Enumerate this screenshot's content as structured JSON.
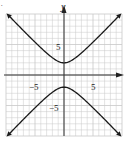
{
  "chart_data": {
    "type": "line",
    "title": "",
    "xlabel": "",
    "ylabel": "y",
    "xlim": [
      -10,
      10
    ],
    "ylim": [
      -10,
      10
    ],
    "grid": true,
    "grid_step": 1,
    "x_ticks_labeled": [
      {
        "value": -5,
        "label": "−5"
      },
      {
        "value": 5,
        "label": "5"
      }
    ],
    "y_ticks_labeled": [
      {
        "value": 5,
        "label": "5"
      },
      {
        "value": -5,
        "label": "−5"
      }
    ],
    "series": [
      {
        "name": "upper branch",
        "equation": "y^2/4 - x^2/4 = 1 (upper)",
        "vertex": [
          0,
          2
        ],
        "endpoints_arrows": [
          [
            -10,
            10.2
          ],
          [
            10,
            10.2
          ]
        ]
      },
      {
        "name": "lower branch",
        "equation": "y^2/4 - x^2/4 = 1 (lower)",
        "vertex": [
          0,
          -2
        ],
        "endpoints_arrows": [
          [
            -10,
            -10.2
          ],
          [
            10,
            -10.2
          ]
        ]
      }
    ],
    "curve": {
      "a": 2,
      "b": 2,
      "orientation": "vertical hyperbola"
    }
  },
  "labels": {
    "y_axis": "y",
    "x_tick_neg5": "−5",
    "x_tick_5": "5",
    "y_tick_5": "5",
    "y_tick_neg5": "−5"
  },
  "colors": {
    "grid": "#c8c8c8",
    "axis": "#333333",
    "curve": "#1a1a1a",
    "background": "#ffffff"
  }
}
